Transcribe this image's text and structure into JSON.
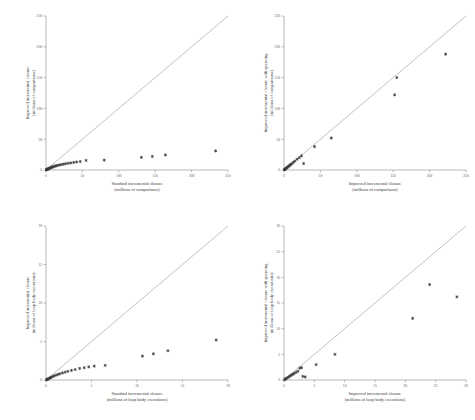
{
  "figure": {
    "background": "#ffffff",
    "point_color": "#3c3c3c",
    "line_color": "#8e8e8e",
    "axis_color": "#8a8a8a"
  },
  "chart_data": [
    {
      "panel": "top-left",
      "type": "scatter",
      "title": "",
      "xlabel": "Standard incremental closure",
      "xlabel_units": "(millions of comparisons)",
      "ylabel": "Improved incremental closure",
      "ylabel_units": "(millions of comparisons)",
      "xlim": [
        0,
        250
      ],
      "ylim": [
        0,
        250
      ],
      "xticks": [
        0,
        50,
        100,
        150,
        200,
        250
      ],
      "yticks": [
        0,
        50,
        100,
        150,
        200,
        250
      ],
      "grid": false,
      "legend": "none",
      "reference_line": {
        "type": "identity",
        "from": [
          0,
          0
        ],
        "to": [
          250,
          250
        ]
      },
      "x": [
        0.4,
        0.7,
        1.1,
        1.5,
        2.0,
        2.6,
        3.2,
        4.0,
        4.8,
        5.6,
        6.5,
        7.4,
        8.5,
        9.6,
        11.0,
        12.5,
        14.0,
        16.0,
        18.5,
        21.0,
        24.0,
        27.0,
        30.5,
        34.0,
        38.0,
        42.0,
        47.0,
        55.0,
        80.0,
        131.0,
        146.0,
        164.0,
        233.0
      ],
      "y": [
        0.3,
        0.5,
        0.8,
        1.0,
        1.3,
        1.7,
        2.0,
        2.5,
        2.9,
        3.3,
        3.8,
        4.2,
        4.7,
        5.2,
        5.8,
        6.4,
        6.9,
        7.5,
        8.2,
        8.8,
        9.5,
        10.2,
        10.9,
        11.5,
        12.3,
        13.0,
        13.8,
        15.5,
        16.0,
        20.5,
        22.0,
        24.5,
        31.0
      ]
    },
    {
      "panel": "top-right",
      "type": "scatter",
      "title": "",
      "xlabel": "Improved incremental closure",
      "xlabel_units": "(millions of comparisons)",
      "ylabel": "Improved incremental closure with queueing",
      "ylabel_units": "(millions of comparisons)",
      "xlim": [
        0,
        250
      ],
      "ylim": [
        0,
        250
      ],
      "xticks": [
        0,
        50,
        100,
        150,
        200,
        250
      ],
      "yticks": [
        0,
        50,
        100,
        150,
        200,
        250
      ],
      "grid": false,
      "legend": "none",
      "reference_line": {
        "type": "identity",
        "from": [
          0,
          0
        ],
        "to": [
          250,
          250
        ]
      },
      "x": [
        0.5,
        0.9,
        1.4,
        2.0,
        2.8,
        3.6,
        4.5,
        5.5,
        6.5,
        7.5,
        8.5,
        9.5,
        11.0,
        13.0,
        15.0,
        18.0,
        21.0,
        24.0,
        27.0,
        42.0,
        65.0,
        152.0,
        155.0,
        222.0
      ],
      "y": [
        0.4,
        0.8,
        1.3,
        1.9,
        2.6,
        3.4,
        4.3,
        5.2,
        6.2,
        7.2,
        8.2,
        9.2,
        10.5,
        12.5,
        14.5,
        17.5,
        20.0,
        23.0,
        10.5,
        38.0,
        52.0,
        122.0,
        150.0,
        188.0
      ]
    },
    {
      "panel": "bottom-left",
      "type": "scatter",
      "title": "",
      "xlabel": "Standard incremental closure",
      "xlabel_units": "(millions of loop body executions)",
      "ylabel": "Improved incremental closure",
      "ylabel_units": "(millions of loop body executions)",
      "xlim": [
        0,
        20
      ],
      "ylim": [
        0,
        20
      ],
      "xticks": [
        0,
        5,
        10,
        15,
        20
      ],
      "yticks": [
        0,
        5,
        10,
        15,
        20
      ],
      "grid": false,
      "legend": "none",
      "reference_line": {
        "type": "identity",
        "from": [
          0,
          0
        ],
        "to": [
          20,
          20
        ]
      },
      "x": [
        0.05,
        0.1,
        0.15,
        0.2,
        0.3,
        0.4,
        0.5,
        0.6,
        0.75,
        0.9,
        1.1,
        1.3,
        1.5,
        1.8,
        2.1,
        2.4,
        2.8,
        3.2,
        3.7,
        4.2,
        4.7,
        5.3,
        6.5,
        10.6,
        11.8,
        13.4,
        18.7
      ],
      "y": [
        0.03,
        0.06,
        0.09,
        0.12,
        0.18,
        0.24,
        0.3,
        0.36,
        0.45,
        0.54,
        0.62,
        0.72,
        0.8,
        0.92,
        1.02,
        1.12,
        1.25,
        1.35,
        1.5,
        1.6,
        1.7,
        1.8,
        1.9,
        3.1,
        3.4,
        3.8,
        5.2
      ]
    },
    {
      "panel": "bottom-right",
      "type": "scatter",
      "title": "",
      "xlabel": "Improved incremental closure",
      "xlabel_units": "(millions of loop body executions)",
      "ylabel": "Improved incremental closure with queueing",
      "ylabel_units": "(millions of loop body executions)",
      "xlim": [
        0,
        30
      ],
      "ylim": [
        0,
        30
      ],
      "xticks": [
        0,
        5,
        10,
        15,
        20,
        25,
        30
      ],
      "yticks": [
        0,
        5,
        10,
        15,
        20,
        25,
        30
      ],
      "grid": false,
      "legend": "none",
      "reference_line": {
        "type": "identity",
        "from": [
          0,
          0
        ],
        "to": [
          30,
          30
        ]
      },
      "x": [
        0.1,
        0.2,
        0.35,
        0.5,
        0.7,
        0.9,
        1.1,
        1.3,
        1.5,
        1.7,
        2.0,
        2.3,
        2.6,
        2.9,
        3.1,
        3.5,
        5.3,
        8.4,
        21.2,
        24.0,
        28.5
      ],
      "y": [
        0.08,
        0.16,
        0.28,
        0.4,
        0.55,
        0.7,
        0.85,
        1.0,
        1.15,
        1.3,
        1.5,
        1.7,
        2.3,
        2.4,
        0.7,
        0.6,
        3.0,
        5.0,
        12.0,
        18.6,
        16.2
      ]
    }
  ]
}
